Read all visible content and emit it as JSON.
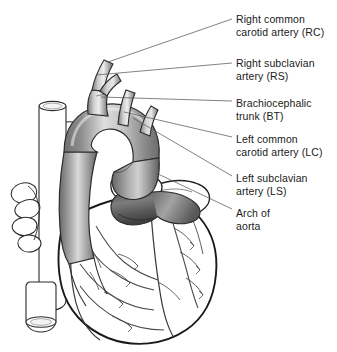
{
  "figure": {
    "background_color": "#ffffff",
    "line_color": "#2b2b2b",
    "leader_color": "#555555",
    "text_color": "#1a1a1a",
    "vessel_shade_light": "#f2f2f2",
    "vessel_shade_mid": "#b8b8b8",
    "vessel_shade_dark": "#6e6e6e",
    "vessel_shade_darkest": "#4a4a4a",
    "width": 337,
    "height": 352
  },
  "labels": [
    {
      "id": "rc",
      "abbr": "RC",
      "line1": "Right common",
      "line2": "carotid artery (RC)",
      "x": 236,
      "y": 13,
      "leader": {
        "x1": 232,
        "y1": 19,
        "x2": 108,
        "y2": 62
      }
    },
    {
      "id": "rs",
      "abbr": "RS",
      "line1": "Right subclavian",
      "line2": "artery (RS)",
      "x": 236,
      "y": 57,
      "leader": {
        "x1": 232,
        "y1": 63,
        "x2": 96,
        "y2": 75
      }
    },
    {
      "id": "bt",
      "abbr": "BT",
      "line1": "Brachiocephalic",
      "line2": "trunk (BT)",
      "x": 236,
      "y": 97,
      "leader": {
        "x1": 232,
        "y1": 101,
        "x2": 101,
        "y2": 97
      }
    },
    {
      "id": "lc",
      "abbr": "LC",
      "line1": "Left common",
      "line2": "carotid artery (LC)",
      "x": 236,
      "y": 133,
      "leader": {
        "x1": 232,
        "y1": 137,
        "x2": 124,
        "y2": 112
      }
    },
    {
      "id": "ls",
      "abbr": "LS",
      "line1": "Left subclavian",
      "line2": "artery (LS)",
      "x": 236,
      "y": 172,
      "leader": {
        "x1": 232,
        "y1": 176,
        "x2": 133,
        "y2": 118
      }
    },
    {
      "id": "arch",
      "abbr": "Arch",
      "line1": "Arch of",
      "line2": "aorta",
      "x": 236,
      "y": 207,
      "leader": {
        "x1": 232,
        "y1": 209,
        "x2": 156,
        "y2": 173
      }
    }
  ]
}
